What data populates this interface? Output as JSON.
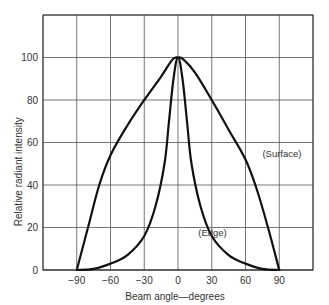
{
  "chart_data": {
    "type": "line",
    "title": "",
    "xlabel": "Beam angle—degrees",
    "ylabel": "Relative radiant intensity",
    "xlim": [
      -120,
      120
    ],
    "ylim": [
      0,
      120
    ],
    "xticks": [
      -90,
      -60,
      -30,
      0,
      30,
      60,
      90
    ],
    "xtick_labels": [
      "−90",
      "−60",
      "−30",
      "0",
      "30",
      "60",
      "90"
    ],
    "xgrid": [
      -120,
      -90,
      -60,
      -30,
      0,
      30,
      60,
      90,
      120
    ],
    "yticks": [
      0,
      20,
      40,
      60,
      80,
      100
    ],
    "ytick_labels": [
      "0",
      "20",
      "40",
      "60",
      "80",
      "100"
    ],
    "ygrid": [
      0,
      20,
      40,
      60,
      80,
      100,
      120
    ],
    "grid": true,
    "legend": "none (inline annotations)",
    "series": [
      {
        "name": "Surface",
        "annotation": "(Surface)",
        "x": [
          -90,
          -80,
          -70,
          -60,
          -45,
          -30,
          -15,
          -5,
          0,
          5,
          15,
          30,
          45,
          60,
          70,
          80,
          90
        ],
        "y": [
          0,
          20,
          40,
          54,
          68,
          80,
          91,
          99,
          100,
          99,
          93,
          80,
          66,
          52,
          38,
          20,
          0
        ]
      },
      {
        "name": "Edge",
        "annotation": "(Edge)",
        "x": [
          -90,
          -75,
          -60,
          -45,
          -30,
          -20,
          -12,
          -8,
          -4,
          0,
          4,
          8,
          12,
          20,
          30,
          45,
          60,
          75,
          90
        ],
        "y": [
          0,
          0.5,
          3,
          7,
          16,
          30,
          50,
          70,
          90,
          100,
          90,
          70,
          50,
          30,
          16,
          7,
          3,
          0.5,
          0
        ]
      }
    ],
    "annotations": [
      {
        "text": "(Surface)",
        "x": 75,
        "y": 53
      },
      {
        "text": "(Edge)",
        "x": 18,
        "y": 16
      }
    ]
  },
  "layout": {
    "plot": {
      "left": 43,
      "right": 313,
      "top": 15,
      "bottom": 270
    },
    "curve_color": "#111111",
    "grid_color": "#555555"
  }
}
